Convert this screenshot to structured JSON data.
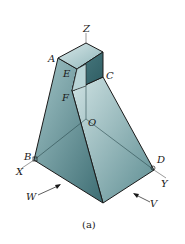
{
  "figure": {
    "caption": "(a)",
    "colors": {
      "face_light": "#a9c9cc",
      "face_mid": "#6f9ea3",
      "face_dark": "#3f6f75",
      "edge": "#1a1a1a",
      "axis": "#555555"
    },
    "labels": {
      "Z": "Z",
      "A": "A",
      "E": "E",
      "C": "C",
      "F": "F",
      "O": "O",
      "B": "B",
      "D": "D",
      "X": "X",
      "Y": "Y",
      "W": "W",
      "V": "V"
    }
  }
}
